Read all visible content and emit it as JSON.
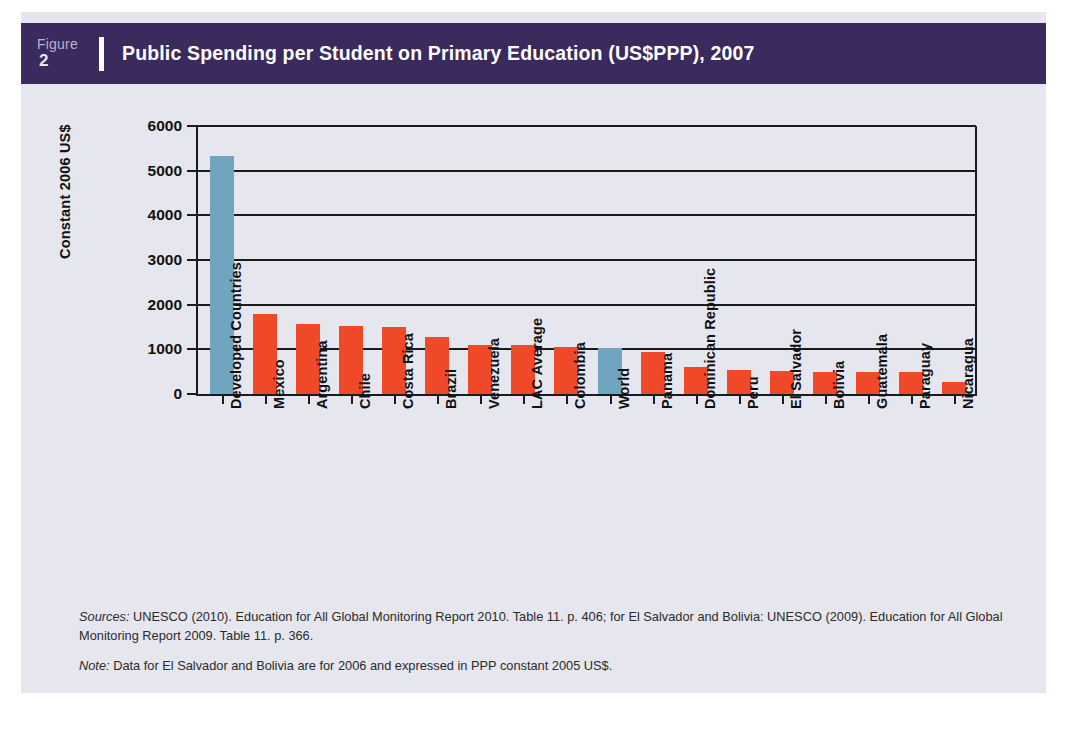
{
  "header": {
    "figure_word": "Figure",
    "figure_number": "2",
    "title": "Public Spending per Student on Primary Education (US$PPP), 2007",
    "band_color": "#3A2A5D"
  },
  "panel": {
    "background_color": "#E6E6EE"
  },
  "chart_data": {
    "type": "bar",
    "title": "Public Spending per Student on Primary Education (US$PPP), 2007",
    "xlabel": "",
    "ylabel": "Constant 2006 US$",
    "ylim": [
      0,
      6000
    ],
    "ytick_values": [
      0,
      1000,
      2000,
      3000,
      4000,
      5000,
      6000
    ],
    "ytick_labels": [
      "0",
      "1000",
      "2000",
      "3000",
      "4000",
      "5000",
      "6000"
    ],
    "grid": "horizontal",
    "legend": "none",
    "categories": [
      "Developed Countries",
      "Mexico",
      "Argentina",
      "Chile",
      "Costa Rica",
      "Brazil",
      "Venezuela",
      "LAC Average",
      "Colombia",
      "World",
      "Panama",
      "Dominican Republic",
      "Peru",
      "El Salvador",
      "Bolivia",
      "Guatemala",
      "Paraguay",
      "Nicaragua"
    ],
    "values": [
      5330,
      1790,
      1560,
      1520,
      1500,
      1270,
      1090,
      1090,
      1050,
      1040,
      950,
      600,
      540,
      520,
      490,
      490,
      490,
      280
    ],
    "bar_colors": [
      "#6FA5BE",
      "#F0492A",
      "#F0492A",
      "#F0492A",
      "#F0492A",
      "#F0492A",
      "#F0492A",
      "#F0492A",
      "#F0492A",
      "#6FA5BE",
      "#F0492A",
      "#F0492A",
      "#F0492A",
      "#F0492A",
      "#F0492A",
      "#F0492A",
      "#F0492A",
      "#F0492A"
    ],
    "highlight_color": "#6FA5BE",
    "series_color": "#F0492A"
  },
  "footnotes": {
    "sources_label": "Sources:",
    "sources_text": " UNESCO (2010). Education for All Global Monitoring Report 2010.  Table 11. p. 406; for El Salvador and Bolivia: UNESCO (2009). Education for All Global Monitoring Report 2009. Table 11. p. 366.",
    "note_label": "Note:",
    "note_text": " Data for El Salvador and Bolivia are for 2006 and expressed in PPP constant 2005 US$."
  }
}
